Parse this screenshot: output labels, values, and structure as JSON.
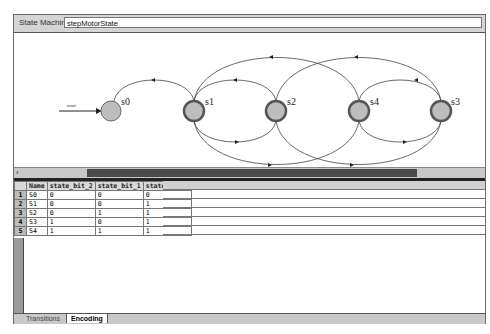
{
  "header": {
    "label": "State Machine:",
    "value": "stepMotorState"
  },
  "diagram": {
    "reset_label": "reset",
    "states": [
      {
        "id": "s0",
        "label": "s0",
        "x": 97,
        "y": 78
      },
      {
        "id": "s1",
        "label": "s1",
        "x": 180,
        "y": 78
      },
      {
        "id": "s2",
        "label": "s2",
        "x": 262,
        "y": 78
      },
      {
        "id": "s4",
        "label": "s4",
        "x": 345,
        "y": 78
      },
      {
        "id": "s3",
        "label": "s3",
        "x": 427,
        "y": 78
      }
    ]
  },
  "table": {
    "columns": [
      "Name",
      "state_bit_2",
      "state_bit_1",
      "state_bit_0"
    ],
    "rows": [
      {
        "n": "1",
        "name": "S0",
        "b2": "0",
        "b1": "0",
        "b0": "0"
      },
      {
        "n": "2",
        "name": "S1",
        "b2": "0",
        "b1": "0",
        "b0": "1"
      },
      {
        "n": "3",
        "name": "S2",
        "b2": "0",
        "b1": "1",
        "b0": "1"
      },
      {
        "n": "4",
        "name": "S3",
        "b2": "1",
        "b1": "0",
        "b0": "1"
      },
      {
        "n": "5",
        "name": "S4",
        "b2": "1",
        "b1": "1",
        "b0": "1"
      }
    ]
  },
  "tabs": [
    {
      "label": "Transitions",
      "active": false
    },
    {
      "label": "Encoding",
      "active": true
    }
  ],
  "scroll_arrow": "‹"
}
